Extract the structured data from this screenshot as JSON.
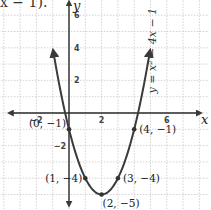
{
  "header": {
    "fragment_text": "x − 1)."
  },
  "chart_data": {
    "type": "line",
    "title": "",
    "equation": "y = x² − 4x − 1",
    "xlabel": "x",
    "ylabel": "y",
    "xlim": [
      -4.2,
      8.6
    ],
    "ylim": [
      -5.9,
      7.0
    ],
    "grid": true,
    "x_ticks": [
      {
        "value": -2,
        "label": "−2"
      },
      {
        "value": 2,
        "label": "2"
      },
      {
        "value": 6,
        "label": "6"
      }
    ],
    "y_ticks": [
      {
        "value": 6,
        "label": "6"
      },
      {
        "value": 4,
        "label": "4"
      },
      {
        "value": 2,
        "label": "2"
      },
      {
        "value": -2,
        "label": "−2"
      }
    ],
    "series": [
      {
        "name": "y = x² − 4x − 1",
        "function": "x^2 - 4x - 1",
        "x_range": [
          -0.95,
          4.95
        ]
      }
    ],
    "points": [
      {
        "x": 0,
        "y": -1,
        "label": "(0, −1)"
      },
      {
        "x": 4,
        "y": -1,
        "label": "(4, −1)"
      },
      {
        "x": 1,
        "y": -4,
        "label": "(1, −4)"
      },
      {
        "x": 3,
        "y": -4,
        "label": "(3, −4)"
      },
      {
        "x": 2,
        "y": -5,
        "label": "(2, −5)"
      }
    ]
  },
  "layout": {
    "origin_px": [
      69,
      113
    ],
    "unit_px": 16.3,
    "colors": {
      "curve": "#3a3a3a",
      "axis": "#2a2a2a",
      "grid": "#c8c8c8",
      "point": "#333333"
    }
  }
}
